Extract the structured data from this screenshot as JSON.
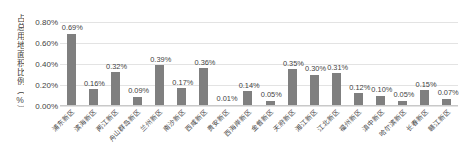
{
  "chart_data": {
    "type": "bar",
    "title": "",
    "subtitle": "",
    "xlabel": "",
    "ylabel": "占总用地面积比例（%）",
    "ylim": [
      0,
      0.8
    ],
    "y_tick_labels": [
      "0.00%",
      "0.20%",
      "0.40%",
      "0.60%",
      "0.80%"
    ],
    "y_tick_values": [
      0,
      0.2,
      0.4,
      0.6,
      0.8
    ],
    "grid": true,
    "legend": "none",
    "bar_color": "#7f7f7f",
    "value_label_suffix": "%",
    "categories": [
      "浦东新区",
      "滨海新区",
      "两江新区",
      "舟山群岛新区",
      "兰州新区",
      "南沙新区",
      "西咸新区",
      "贵安新区",
      "西海岸新区",
      "金普新区",
      "天府新区",
      "湘江新区",
      "江北新区",
      "福州新区",
      "滇中新区",
      "哈尔滨新区",
      "长春新区",
      "赣江新区"
    ],
    "values": [
      0.69,
      0.16,
      0.32,
      0.09,
      0.39,
      0.17,
      0.36,
      0.01,
      0.14,
      0.05,
      0.35,
      0.3,
      0.31,
      0.12,
      0.1,
      0.05,
      0.15,
      0.07
    ],
    "value_labels": [
      "0.69%",
      "0.16%",
      "0.32%",
      "0.09%",
      "0.39%",
      "0.17%",
      "0.36%",
      "0.01%",
      "0.14%",
      "0.05%",
      "0.35%",
      "0.30%",
      "0.31%",
      "0.12%",
      "0.10%",
      "0.05%",
      "0.15%",
      "0.07%"
    ]
  }
}
